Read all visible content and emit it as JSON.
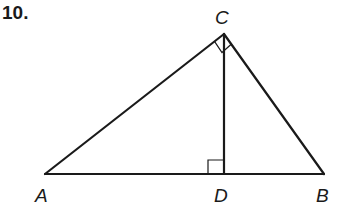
{
  "problem": {
    "number": "10."
  },
  "diagram": {
    "points": {
      "A": {
        "label": "A",
        "x": 45,
        "y": 174
      },
      "B": {
        "label": "B",
        "x": 324,
        "y": 174
      },
      "C": {
        "label": "C",
        "x": 224,
        "y": 34
      },
      "D": {
        "label": "D",
        "x": 224,
        "y": 174
      }
    },
    "segments": [
      "AB",
      "AC",
      "BC",
      "CD"
    ],
    "right_angles": [
      "ACB",
      "CDA"
    ],
    "stroke_color": "#1a1a1a"
  }
}
